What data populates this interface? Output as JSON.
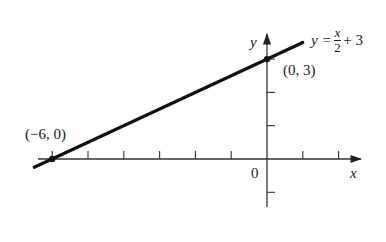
{
  "chart_data": {
    "type": "line",
    "title": "",
    "equation": {
      "lhs": "y",
      "eq": "=",
      "numerator": "x",
      "denominator": "2",
      "rest": "+ 3"
    },
    "series": [
      {
        "name": "y = x/2 + 3",
        "slope": 0.5,
        "intercept": 3,
        "x": [
          -6.5,
          1
        ],
        "y": [
          -0.25,
          3.5
        ]
      }
    ],
    "points": [
      {
        "x": -6,
        "y": 0,
        "label": "(−6, 0)"
      },
      {
        "x": 0,
        "y": 3,
        "label": "(0, 3)"
      }
    ],
    "xlabel": "x",
    "ylabel": "y",
    "origin_label": "0",
    "x_ticks": [
      -6,
      -5,
      -4,
      -3,
      -2,
      -1,
      1,
      2
    ],
    "y_ticks": [
      -1,
      1,
      2,
      3
    ],
    "xlim": [
      -6.6,
      2.6
    ],
    "ylim": [
      -1.4,
      3.8
    ],
    "grid": false,
    "legend": "none",
    "colors": {
      "line": "#111111",
      "axis": "#333333",
      "text": "#1a1a1a"
    }
  },
  "labels": {
    "point_a": "(−6, 0)",
    "point_b": "(0, 3)",
    "axis_x": "x",
    "axis_y": "y",
    "origin": "0",
    "eq_lhs": "y =",
    "eq_num": "x",
    "eq_den": "2",
    "eq_rest": "+ 3"
  }
}
